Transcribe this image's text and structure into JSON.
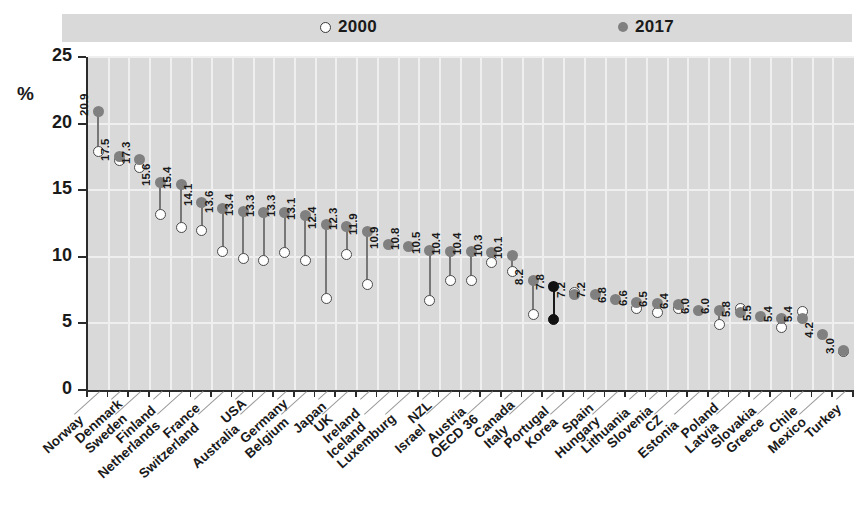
{
  "axis_title": "%",
  "legend": {
    "items": [
      {
        "label": "2000",
        "marker": "open-circle-icon"
      },
      {
        "label": "2017",
        "marker": "filled-circle-icon"
      }
    ]
  },
  "y_axis": {
    "ticks": [
      "0",
      "5",
      "10",
      "15",
      "20",
      "25"
    ],
    "min": 0,
    "max": 25
  },
  "chart_data": {
    "type": "scatter",
    "title": "",
    "subtitle": "",
    "xlabel": "",
    "ylabel": "%",
    "ylim": [
      0,
      25
    ],
    "grid": true,
    "legend_position": "top",
    "highlight": "Portugal",
    "categories": [
      "Norway",
      "Denmark",
      "Sweden",
      "Finland",
      "Netherlands",
      "France",
      "Switzerland",
      "USA",
      "Australia",
      "Germany",
      "Belgium",
      "Japan",
      "UK",
      "Ireland",
      "Iceland",
      "Luxemburg",
      "NZL",
      "Israel",
      "Austria",
      "OECD 36",
      "Canada",
      "Italy",
      "Portugal",
      "Korea",
      "Spain",
      "Hungary",
      "Lithuania",
      "Slovenia",
      "CZ",
      "Estonia",
      "Poland",
      "Latvia",
      "Slovakia",
      "Greece",
      "Chile",
      "Mexico",
      "Turkey"
    ],
    "series": [
      {
        "name": "2017",
        "values": [
          20.9,
          17.5,
          17.3,
          15.6,
          15.4,
          14.1,
          13.6,
          13.4,
          13.3,
          13.3,
          13.1,
          12.4,
          12.3,
          11.9,
          10.9,
          10.8,
          10.5,
          10.4,
          10.4,
          10.3,
          10.1,
          8.2,
          7.8,
          7.2,
          7.2,
          6.8,
          6.6,
          6.5,
          6.4,
          6.0,
          6.0,
          5.8,
          5.5,
          5.4,
          5.4,
          4.2,
          3.0
        ],
        "labels": [
          "20.9",
          "17.5",
          "17.3",
          "15.6",
          "15.4",
          "14.1",
          "13.6",
          "13.4",
          "13.3",
          "13.3",
          "13.1",
          "12.4",
          "12.3",
          "11.9",
          "10.9",
          "10.8",
          "10.5",
          "10.4",
          "10.4",
          "10.3",
          "10.1",
          "8.2",
          "7.8",
          "7.2",
          "7.2",
          "6.8",
          "6.6",
          "6.5",
          "6.4",
          "6.0",
          "6.0",
          "5.8",
          "5.5",
          "5.4",
          "5.4",
          "4.2",
          "3.0"
        ]
      },
      {
        "name": "2000",
        "values": [
          17.9,
          17.2,
          16.7,
          13.2,
          12.2,
          12.0,
          10.4,
          9.9,
          9.7,
          10.3,
          9.7,
          6.9,
          10.2,
          7.9,
          null,
          null,
          6.7,
          8.2,
          8.2,
          9.6,
          8.9,
          5.7,
          5.3,
          7.3,
          null,
          null,
          6.1,
          5.8,
          6.1,
          null,
          4.9,
          6.1,
          null,
          4.7,
          5.9,
          null,
          2.9
        ]
      }
    ]
  },
  "chart_category_labels": [
    {
      "name": "Norway",
      "row": 1,
      "bold": false
    },
    {
      "name": "Denmark",
      "row": 0,
      "bold": false
    },
    {
      "name": "Sweden",
      "row": 1,
      "bold": false
    },
    {
      "name": "Finland",
      "row": 0,
      "bold": false
    },
    {
      "name": "Netherlands",
      "row": 1,
      "bold": false
    },
    {
      "name": "France",
      "row": 0,
      "bold": false
    },
    {
      "name": "Switzerland",
      "row": 1,
      "bold": false
    },
    {
      "name": "USA",
      "row": 0,
      "bold": false
    },
    {
      "name": "Australia",
      "row": 1,
      "bold": false
    },
    {
      "name": "Germany",
      "row": 0,
      "bold": false
    },
    {
      "name": "Belgium",
      "row": 1,
      "bold": false
    },
    {
      "name": "Japan",
      "row": 0,
      "bold": false
    },
    {
      "name": "UK",
      "row": 1,
      "bold": false
    },
    {
      "name": "Ireland",
      "row": 0,
      "bold": false
    },
    {
      "name": "Iceland",
      "row": 1,
      "bold": false
    },
    {
      "name": "Luxemburg",
      "row": 1,
      "bold": false
    },
    {
      "name": "NZL",
      "row": 0,
      "bold": true
    },
    {
      "name": "Israel",
      "row": 1,
      "bold": false
    },
    {
      "name": "Austria",
      "row": 0,
      "bold": false
    },
    {
      "name": "OECD 36",
      "row": 1,
      "bold": false
    },
    {
      "name": "Canada",
      "row": 0,
      "bold": false
    },
    {
      "name": "Italy",
      "row": 1,
      "bold": false
    },
    {
      "name": "Portugal",
      "row": 0,
      "bold": false
    },
    {
      "name": "Korea",
      "row": 1,
      "bold": false
    },
    {
      "name": "Spain",
      "row": 0,
      "bold": false
    },
    {
      "name": "Hungary",
      "row": 1,
      "bold": false
    },
    {
      "name": "Lithuania",
      "row": 0,
      "bold": false
    },
    {
      "name": "Slovenia",
      "row": 0,
      "bold": false
    },
    {
      "name": "CZ",
      "row": 1,
      "bold": false
    },
    {
      "name": "Estonia",
      "row": 1,
      "bold": false
    },
    {
      "name": "Poland",
      "row": 0,
      "bold": false
    },
    {
      "name": "Latvia",
      "row": 1,
      "bold": false
    },
    {
      "name": "Slovakia",
      "row": 0,
      "bold": false
    },
    {
      "name": "Greece",
      "row": 1,
      "bold": false
    },
    {
      "name": "Chile",
      "row": 0,
      "bold": false
    },
    {
      "name": "Mexico",
      "row": 1,
      "bold": false
    },
    {
      "name": "Turkey",
      "row": 0,
      "bold": false
    }
  ],
  "colors": {
    "plot_background": "#d9d9d9",
    "marker_2017": "#808080",
    "marker_2000_fill": "#ffffff",
    "marker_2000_stroke": "#4a4a4a",
    "highlight": "#111111",
    "axis": "#2b2b2b",
    "gridline": "#efefef"
  }
}
